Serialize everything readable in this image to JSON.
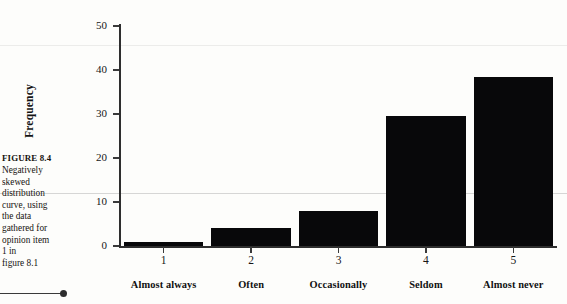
{
  "caption": {
    "figure_number": "FIGURE 8.4",
    "lines": [
      "Negatively",
      "skewed",
      "distribution",
      "curve, using",
      "the data",
      "gathered for",
      "opinion item",
      "1 in",
      "figure 8.1"
    ]
  },
  "chart_data": {
    "type": "bar",
    "title": "",
    "xlabel": "",
    "ylabel": "Frequency",
    "categories": [
      "1",
      "2",
      "3",
      "4",
      "5"
    ],
    "category_names": [
      "Almost always",
      "Often",
      "Occasionally",
      "Seldom",
      "Almost never"
    ],
    "values": [
      1,
      4,
      8,
      29.5,
      38.5
    ],
    "ylim": [
      0,
      50
    ],
    "yticks": [
      0,
      10,
      20,
      30,
      40,
      50
    ],
    "ytick_labels": [
      "0",
      "10",
      "20",
      "30",
      "40",
      "50"
    ],
    "xticks": [
      1,
      2,
      3,
      4,
      5
    ],
    "grid": false,
    "legend": "none",
    "bar_color": "#08080a",
    "background_color": "#fdfdfb",
    "axis_color": "#2e2e2e"
  }
}
